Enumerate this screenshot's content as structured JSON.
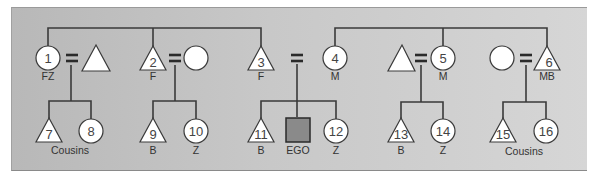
{
  "diagram": {
    "type": "kinship-chart",
    "colors": {
      "panel_left": "#b8b8b8",
      "panel_right": "#d6d6d6",
      "shape_fill": "#ffffff",
      "ego_fill": "#8a8a8a",
      "line": "#3a3a3a"
    },
    "generation1": [
      {
        "id": "1",
        "symbol": "circle",
        "number": "1",
        "label": "FZ"
      },
      {
        "id": "spouse1",
        "symbol": "triangle",
        "number": "",
        "label": ""
      },
      {
        "id": "2",
        "symbol": "triangle",
        "number": "2",
        "label": "F"
      },
      {
        "id": "spouse2",
        "symbol": "circle",
        "number": "",
        "label": ""
      },
      {
        "id": "3",
        "symbol": "triangle",
        "number": "3",
        "label": "F"
      },
      {
        "id": "4",
        "symbol": "circle",
        "number": "4",
        "label": "M"
      },
      {
        "id": "spouse5",
        "symbol": "triangle",
        "number": "",
        "label": ""
      },
      {
        "id": "5",
        "symbol": "circle",
        "number": "5",
        "label": "M"
      },
      {
        "id": "spouse6",
        "symbol": "circle",
        "number": "",
        "label": ""
      },
      {
        "id": "6",
        "symbol": "triangle",
        "number": "6",
        "label": "MB"
      }
    ],
    "generation2": [
      {
        "id": "7",
        "symbol": "triangle",
        "number": "7",
        "label": ""
      },
      {
        "id": "8",
        "symbol": "circle",
        "number": "8",
        "label": ""
      },
      {
        "id": "9",
        "symbol": "triangle",
        "number": "9",
        "label": "B"
      },
      {
        "id": "10",
        "symbol": "circle",
        "number": "10",
        "label": "Z"
      },
      {
        "id": "11",
        "symbol": "triangle",
        "number": "11",
        "label": "B"
      },
      {
        "id": "ego",
        "symbol": "square",
        "number": "",
        "label": "EGO"
      },
      {
        "id": "12",
        "symbol": "circle",
        "number": "12",
        "label": "Z"
      },
      {
        "id": "13",
        "symbol": "triangle",
        "number": "13",
        "label": "B"
      },
      {
        "id": "14",
        "symbol": "circle",
        "number": "14",
        "label": "Z"
      },
      {
        "id": "15",
        "symbol": "triangle",
        "number": "15",
        "label": ""
      },
      {
        "id": "16",
        "symbol": "circle",
        "number": "16",
        "label": ""
      }
    ],
    "group_labels": {
      "left_cousins": "Cousins",
      "right_cousins": "Cousins"
    },
    "marriage_symbol": "="
  }
}
